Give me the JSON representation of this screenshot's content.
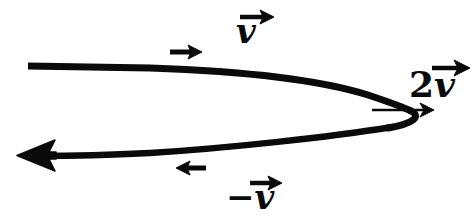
{
  "figure": {
    "background_color": "#ffffff",
    "ink_color": "#0a0a0a",
    "width": 474,
    "height": 220
  },
  "labels": {
    "top_vector": {
      "name": "v",
      "text": "v",
      "has_overarrow": true,
      "x": 236,
      "y": 14
    },
    "right_vector": {
      "name": "2v",
      "coefficient": "2",
      "text": "v",
      "has_overarrow": true,
      "x": 409,
      "y": 66
    },
    "bottom_vector": {
      "name": "-v",
      "sign": "−",
      "text": "v",
      "has_overarrow": true,
      "x": 226,
      "y": 180
    }
  },
  "markers": {
    "top_direction_arrow": {
      "name": "right-arrow-marker",
      "direction": "right",
      "x1": 170,
      "y1": 52,
      "x2": 200,
      "y2": 52
    },
    "bottom_direction_arrow": {
      "name": "left-arrow-marker",
      "direction": "left",
      "x1": 206,
      "y1": 168,
      "x2": 176,
      "y2": 168
    },
    "cusp_arrow": {
      "name": "resultant-arrow",
      "direction": "right",
      "x1": 372,
      "y1": 110,
      "x2": 433,
      "y2": 110
    }
  },
  "curve": {
    "name": "trajectory-curve",
    "description": "U-shaped parabolic path opening to the left with a cusp on the right",
    "upper_branch_start": {
      "x": 28,
      "y": 66
    },
    "cusp": {
      "x": 411,
      "y": 110
    },
    "lower_branch_end": {
      "x": 36,
      "y": 156
    },
    "stroke_width": 7,
    "arrowhead_at": "lower-left"
  }
}
